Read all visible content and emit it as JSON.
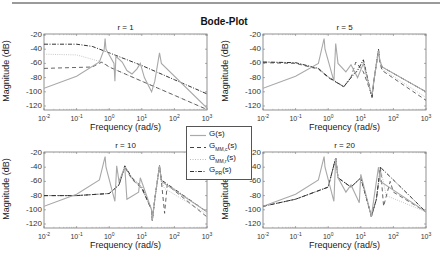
{
  "figure": {
    "title": "Bode-Plot",
    "legend": [
      {
        "label_main": "G",
        "label_sub": "",
        "label_tail": "(s)",
        "style": "solid-light"
      },
      {
        "label_main": "G",
        "label_sub": "MM,c",
        "label_tail": "(s)",
        "style": "dashed"
      },
      {
        "label_main": "G",
        "label_sub": "MM,r",
        "label_tail": "(s)",
        "style": "dotted-light"
      },
      {
        "label_main": "G",
        "label_sub": "PR",
        "label_tail": "(s)",
        "style": "dashdot"
      }
    ]
  },
  "axes_common": {
    "xlabel": "Frequency  (rad/s)",
    "ylabel": "Magnitude (dB)",
    "xtick_base": "10",
    "xtick_exps": [
      "-2",
      "-1",
      "0",
      "1",
      "2",
      "3"
    ],
    "yticks": [
      "-20",
      "-40",
      "-60",
      "-80",
      "-100",
      "-120"
    ]
  },
  "panels": [
    {
      "title": "r = 1"
    },
    {
      "title": "r = 5"
    },
    {
      "title": "r = 10"
    },
    {
      "title": "r = 20"
    }
  ],
  "chart_data": [
    {
      "type": "line",
      "title": "r = 1",
      "xlabel": "Frequency  (rad/s)",
      "ylabel": "Magnitude (dB)",
      "xscale": "log",
      "xlim": [
        0.01,
        1000
      ],
      "ylim": [
        -125,
        -20
      ],
      "series": [
        {
          "name": "G(s)",
          "x": [
            0.01,
            0.1,
            0.5,
            0.7,
            0.75,
            0.8,
            1.4,
            1.5,
            1.6,
            2.5,
            3.5,
            5,
            7,
            9,
            12,
            20,
            25,
            35,
            40,
            1000
          ],
          "y": [
            -95,
            -78,
            -58,
            -40,
            -25,
            -40,
            -60,
            -85,
            -50,
            -58,
            -70,
            -75,
            -68,
            -60,
            -80,
            -100,
            -85,
            -45,
            -60,
            -123
          ]
        },
        {
          "name": "G_MM,c(s)",
          "x": [
            0.01,
            0.3,
            0.6,
            1,
            10,
            100,
            1000
          ],
          "y": [
            -67,
            -65,
            -58,
            -65,
            -85,
            -105,
            -125
          ]
        },
        {
          "name": "G_MM,r(s)",
          "x": [
            0.01,
            0.1,
            0.5,
            1,
            10,
            100,
            1000
          ],
          "y": [
            -47,
            -48,
            -57,
            -65,
            -85,
            -105,
            -125
          ]
        },
        {
          "name": "G_PR(s)",
          "x": [
            0.01,
            0.1,
            0.3,
            1,
            10,
            100,
            1000
          ],
          "y": [
            -33,
            -33,
            -36,
            -45,
            -63,
            -83,
            -103
          ]
        }
      ]
    },
    {
      "type": "line",
      "title": "r = 5",
      "xlabel": "Frequency  (rad/s)",
      "ylabel": "Magnitude (dB)",
      "xscale": "log",
      "xlim": [
        0.01,
        1000
      ],
      "ylim": [
        -125,
        -20
      ],
      "series": [
        {
          "name": "G(s)",
          "x": [
            0.01,
            0.1,
            0.5,
            0.75,
            0.8,
            1.5,
            1.7,
            2,
            3.5,
            5,
            8,
            12,
            20,
            22,
            25,
            35,
            38,
            45,
            1000
          ],
          "y": [
            -95,
            -78,
            -60,
            -25,
            -40,
            -85,
            -32,
            -60,
            -72,
            -62,
            -80,
            -60,
            -100,
            -103,
            -85,
            -42,
            -55,
            -65,
            -100
          ]
        },
        {
          "name": "G_MM,c(s)",
          "x": [
            0.01,
            0.1,
            0.5,
            1,
            3,
            5,
            7,
            12,
            20,
            22,
            25,
            35,
            38,
            45,
            1000
          ],
          "y": [
            -59,
            -60,
            -68,
            -80,
            -93,
            -80,
            -58,
            -72,
            -100,
            -108,
            -85,
            -42,
            -58,
            -70,
            -112
          ]
        },
        {
          "name": "G_MM,r(s)",
          "x": [
            0.01,
            0.1,
            0.5,
            1,
            3,
            5,
            8,
            12,
            20,
            22,
            25,
            35,
            38,
            45,
            1000
          ],
          "y": [
            -58,
            -59,
            -67,
            -79,
            -92,
            -78,
            -68,
            -55,
            -100,
            -106,
            -85,
            -42,
            -57,
            -68,
            -108
          ]
        },
        {
          "name": "G_PR(s)",
          "x": [
            0.01,
            0.1,
            0.5,
            1,
            3,
            5,
            8,
            12,
            20,
            22,
            25,
            35,
            38,
            45,
            1000
          ],
          "y": [
            -58,
            -59,
            -67,
            -79,
            -93,
            -80,
            -70,
            -55,
            -100,
            -108,
            -85,
            -40,
            -55,
            -65,
            -100
          ]
        }
      ]
    },
    {
      "type": "line",
      "title": "r = 10",
      "xlabel": "Frequency  (rad/s)",
      "ylabel": "Magnitude (dB)",
      "xscale": "log",
      "xlim": [
        0.01,
        1000
      ],
      "ylim": [
        -125,
        -20
      ],
      "series": [
        {
          "name": "G(s)",
          "x": [
            0.01,
            0.1,
            0.5,
            0.75,
            0.8,
            1.5,
            1.7,
            2,
            3,
            3.5,
            8,
            9,
            20,
            21,
            25,
            35,
            40,
            1000
          ],
          "y": [
            -95,
            -78,
            -58,
            -25,
            -40,
            -88,
            -38,
            -60,
            -40,
            -85,
            -75,
            -55,
            -100,
            -115,
            -85,
            -38,
            -60,
            -103
          ]
        },
        {
          "name": "G_MM,c(s)",
          "x": [
            0.01,
            0.1,
            1,
            2,
            3,
            5,
            10,
            20,
            21,
            25,
            35,
            40,
            50,
            60,
            1000
          ],
          "y": [
            -80,
            -80,
            -77,
            -65,
            -40,
            -57,
            -70,
            -100,
            -115,
            -85,
            -38,
            -60,
            -105,
            -65,
            -110
          ]
        },
        {
          "name": "G_MM,r(s)",
          "x": [
            0.01,
            0.1,
            1,
            2,
            3,
            5,
            10,
            20,
            21,
            25,
            35,
            40,
            50,
            1000
          ],
          "y": [
            -80,
            -80,
            -77,
            -65,
            -40,
            -57,
            -70,
            -100,
            -115,
            -85,
            -38,
            -60,
            -70,
            -106
          ]
        },
        {
          "name": "G_PR(s)",
          "x": [
            0.01,
            0.1,
            1,
            2,
            3,
            5,
            10,
            20,
            21,
            25,
            35,
            40,
            1000
          ],
          "y": [
            -80,
            -80,
            -77,
            -65,
            -38,
            -55,
            -68,
            -100,
            -115,
            -85,
            -38,
            -58,
            -103
          ]
        }
      ]
    },
    {
      "type": "line",
      "title": "r = 20",
      "xlabel": "Frequency  (rad/s)",
      "ylabel": "Magnitude (dB)",
      "xscale": "log",
      "xlim": [
        0.01,
        1000
      ],
      "ylim": [
        -125,
        -20
      ],
      "series": [
        {
          "name": "G(s)",
          "x": [
            0.01,
            0.1,
            0.5,
            0.75,
            0.8,
            1.5,
            1.7,
            2,
            3.5,
            5,
            9,
            10,
            20,
            21,
            25,
            35,
            40,
            1000
          ],
          "y": [
            -95,
            -78,
            -58,
            -25,
            -40,
            -88,
            -27,
            -55,
            -75,
            -65,
            -90,
            -50,
            -105,
            -110,
            -85,
            -40,
            -60,
            -103
          ]
        },
        {
          "name": "G_MM,c(s)",
          "x": [
            0.01,
            0.1,
            1,
            1.7,
            2,
            5,
            10,
            20,
            21,
            30,
            40,
            50,
            80,
            100,
            1000
          ],
          "y": [
            -95,
            -85,
            -68,
            -27,
            -55,
            -68,
            -55,
            -105,
            -110,
            -85,
            -40,
            -95,
            -60,
            -75,
            -103
          ]
        },
        {
          "name": "G_MM,r(s)",
          "x": [
            0.01,
            0.1,
            1,
            1.7,
            2,
            5,
            10,
            20,
            21,
            30,
            40,
            60,
            1000
          ],
          "y": [
            -95,
            -85,
            -68,
            -27,
            -55,
            -68,
            -55,
            -105,
            -110,
            -85,
            -40,
            -80,
            -103
          ]
        },
        {
          "name": "G_PR(s)",
          "x": [
            0.01,
            0.1,
            1,
            1.7,
            2,
            5,
            10,
            20,
            21,
            30,
            40,
            1000
          ],
          "y": [
            -95,
            -85,
            -68,
            -27,
            -55,
            -68,
            -55,
            -105,
            -110,
            -85,
            -40,
            -103
          ]
        }
      ]
    }
  ]
}
